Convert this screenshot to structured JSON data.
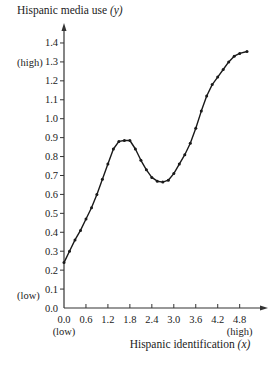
{
  "chart_data": {
    "type": "line",
    "title": "",
    "xlabel": "Hispanic identification",
    "xlabel_var": "(x)",
    "ylabel": "Hispanic media use",
    "ylabel_var": "(y)",
    "xlim": [
      0,
      5.1
    ],
    "ylim": [
      0,
      1.45
    ],
    "x_ticks": [
      0.0,
      0.6,
      1.2,
      1.8,
      2.4,
      3.0,
      3.6,
      4.2,
      4.8
    ],
    "x_tick_labels": [
      "0.0",
      "0.6",
      "1.2",
      "1.8",
      "2.4",
      "3.0",
      "3.6",
      "4.2",
      "4.8"
    ],
    "y_ticks": [
      0.0,
      0.1,
      0.2,
      0.3,
      0.4,
      0.5,
      0.6,
      0.7,
      0.8,
      0.9,
      1.0,
      1.1,
      1.2,
      1.3,
      1.4
    ],
    "y_tick_labels": [
      "0.0",
      "0.1",
      "0.2",
      "0.3",
      "0.4",
      "0.5",
      "0.6",
      "0.7",
      "0.8",
      "0.9",
      "1.0",
      "1.1",
      "1.2",
      "1.3",
      "1.4"
    ],
    "annotations": {
      "x_low": "(low)",
      "x_high": "(high)",
      "y_low": "(low)",
      "y_high": "(high)"
    },
    "grid": false,
    "legend": "none",
    "series": [
      {
        "name": "Hispanic media use",
        "x": [
          0.0,
          0.15,
          0.3,
          0.45,
          0.6,
          0.75,
          0.9,
          1.05,
          1.2,
          1.35,
          1.5,
          1.65,
          1.8,
          1.95,
          2.1,
          2.25,
          2.4,
          2.55,
          2.7,
          2.85,
          3.0,
          3.15,
          3.3,
          3.45,
          3.6,
          3.75,
          3.9,
          4.05,
          4.2,
          4.35,
          4.5,
          4.65,
          4.8,
          5.0
        ],
        "y": [
          0.24,
          0.3,
          0.36,
          0.41,
          0.47,
          0.53,
          0.6,
          0.68,
          0.76,
          0.84,
          0.88,
          0.885,
          0.885,
          0.84,
          0.78,
          0.73,
          0.69,
          0.67,
          0.665,
          0.675,
          0.71,
          0.76,
          0.81,
          0.87,
          0.95,
          1.04,
          1.12,
          1.18,
          1.22,
          1.26,
          1.3,
          1.33,
          1.345,
          1.355
        ]
      }
    ]
  }
}
